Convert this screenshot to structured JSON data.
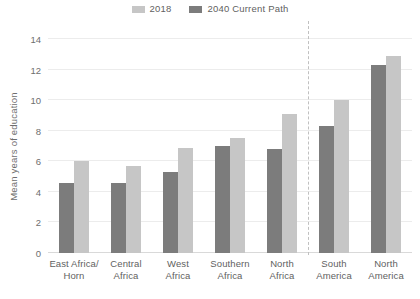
{
  "chart_data": {
    "type": "bar",
    "title": "",
    "xlabel": "",
    "ylabel": "Mean years of education",
    "ylim": [
      0,
      14
    ],
    "yticks": [
      0,
      2,
      4,
      6,
      8,
      10,
      12,
      14
    ],
    "ytick_labels": [
      "0",
      "2",
      "4",
      "6",
      "8",
      "10",
      "12",
      "14"
    ],
    "grid": true,
    "legend_position": "top-center",
    "categories": [
      "East Africa/\nHorn",
      "Central\nAfrica",
      "West\nAfrica",
      "Southern\nAfrica",
      "North\nAfrica",
      "South\nAmerica",
      "North\nAmerica"
    ],
    "series": [
      {
        "name": "2018",
        "color": "#7c7c7c",
        "values": [
          4.6,
          4.6,
          5.3,
          7.0,
          6.8,
          8.3,
          12.3
        ]
      },
      {
        "name": "2040 Current Path",
        "color": "#c6c6c6",
        "values": [
          6.0,
          5.7,
          6.9,
          7.5,
          9.1,
          10.0,
          12.9
        ]
      }
    ],
    "annotations": [
      {
        "name": "region-divider",
        "type": "vertical-dashed-line",
        "after_category": "North\nAfrica",
        "color": "#c0c0c0"
      }
    ]
  },
  "legend": {
    "items": [
      {
        "label": "2018",
        "color": "#c6c6c6"
      },
      {
        "label": "2040 Current Path",
        "color": "#7c7c7c"
      }
    ]
  },
  "axes": {
    "y_title": "Mean years of education"
  },
  "colors": {
    "series_2018": "#7c7c7c",
    "series_2040": "#c6c6c6",
    "gridline": "#ececec",
    "baseline": "#d9d9d9",
    "divider": "#c0c0c0",
    "text": "#6b6b6b",
    "background": "#ffffff"
  }
}
